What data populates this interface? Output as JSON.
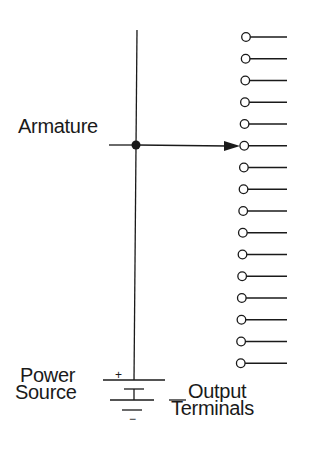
{
  "diagram": {
    "labels": {
      "armature": "Armature",
      "power_line1": "Power",
      "power_line2": "Source",
      "output_line1": "Output",
      "output_line2": "Terminals",
      "plus": "+",
      "minus": "−"
    },
    "terminal_count": 16,
    "selected_terminal_index": 5,
    "colors": {
      "ink": "#1a1a1a",
      "background": "#ffffff"
    }
  }
}
